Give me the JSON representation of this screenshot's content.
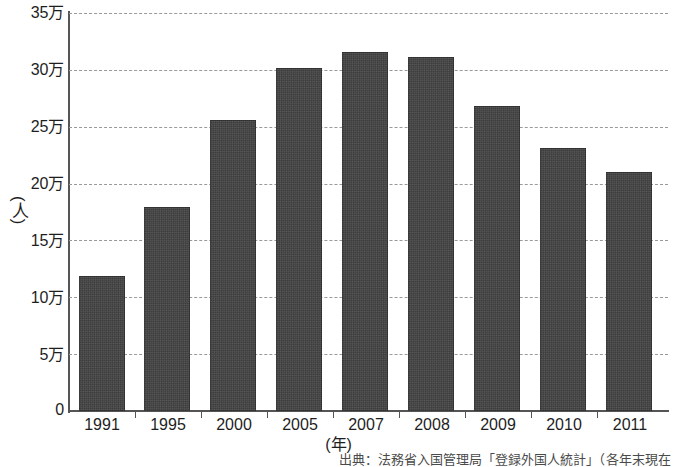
{
  "chart_data": {
    "type": "bar",
    "title": "",
    "categories": [
      "1991",
      "1995",
      "2000",
      "2005",
      "2007",
      "2008",
      "2009",
      "2010",
      "2011"
    ],
    "values": [
      11.9,
      17.9,
      25.6,
      30.2,
      31.6,
      31.1,
      26.8,
      23.1,
      21.0
    ],
    "value_unit": "万人",
    "xlabel": "(年)",
    "ylabel": "(人)",
    "ylim": [
      0,
      35
    ],
    "ytick_values": [
      0,
      5,
      10,
      15,
      20,
      25,
      30,
      35
    ],
    "ytick_labels": [
      "0",
      "5万",
      "10万",
      "15万",
      "20万",
      "25万",
      "30万",
      "35万"
    ],
    "grid": true,
    "gridstyle": "dashed-horizontal",
    "legend": "none",
    "bar_color": "#3d3d3d",
    "source_note": "出典：法務省入国管理局「登録外国人統計」（各年末現在"
  },
  "axes": {
    "y_title": "(人)",
    "x_title": "(年)"
  }
}
